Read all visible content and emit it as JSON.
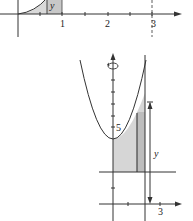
{
  "figure": {
    "top_panel": {
      "x_tick_labels": [
        "1",
        "2",
        "3"
      ],
      "strip_label": "y",
      "dashed_line_at": "3"
    },
    "bottom_panel": {
      "y_tick_label": "5",
      "x_tick_label": "3",
      "height_label": "y",
      "rotation_icon": "rotation-arrow-icon"
    },
    "colors": {
      "line": "#333333",
      "shade": "#d4d4d4",
      "strip": "#bdbdbd"
    }
  }
}
